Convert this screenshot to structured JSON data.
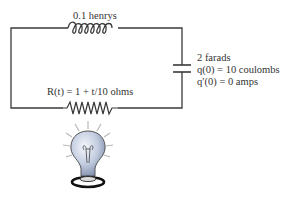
{
  "diagram": {
    "type": "RLC circuit",
    "inductor": {
      "label": "0.1 henrys"
    },
    "capacitor": {
      "label": "2 farads",
      "initial_charge": "q(0) = 10 coulombs",
      "initial_current": "q′(0) = 0 amps"
    },
    "resistor": {
      "label": "R(t) = 1 + t/10 ohms"
    },
    "load": {
      "icon": "light-bulb-icon"
    },
    "colors": {
      "wire": "#3a3a3a",
      "text": "#333333",
      "bulb": "#b9c6dd"
    }
  }
}
